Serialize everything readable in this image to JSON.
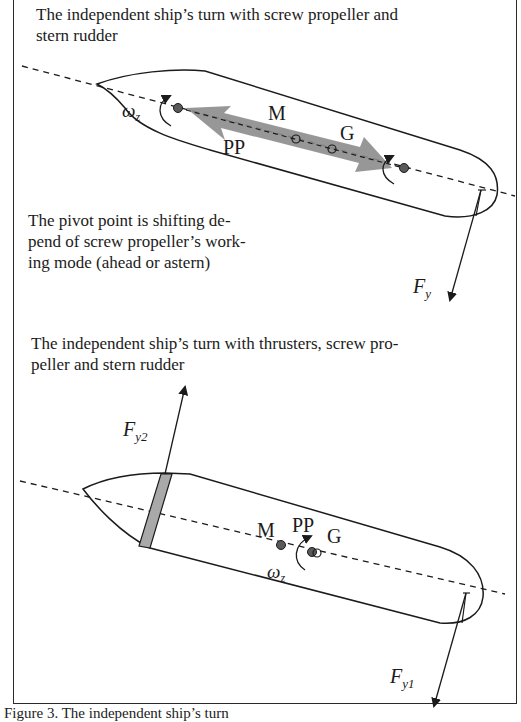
{
  "figure": {
    "panel_top": {
      "title": "The independent ship’s turn with screw propeller and stern rudder",
      "title_line1": "The independent ship’s turn with screw propeller and",
      "title_line2": "stern rudder",
      "labels": {
        "omega": "ω",
        "omega_sub": "z",
        "M": "M",
        "G": "G",
        "PP": "PP",
        "force": "F",
        "force_sub": "y"
      },
      "note_line1": "The pivot point is shifting de-",
      "note_line2": "pend of screw propeller’s work-",
      "note_line3": "ing mode (ahead or astern)"
    },
    "panel_bottom": {
      "title_line1": "The independent ship’s turn with thrusters, screw pro-",
      "title_line2": "peller and stern rudder",
      "labels": {
        "M": "M",
        "PP": "PP",
        "G": "G",
        "omega": "ω",
        "omega_sub": "z",
        "force_bow": "F",
        "force_bow_sub": "y2",
        "force_stern": "F",
        "force_stern_sub": "y1"
      }
    },
    "caption": "Figure 3. The independent ship’s turn",
    "colors": {
      "line": "#1b1b1b",
      "arrow_fill": "#8c8c8c",
      "thruster_fill": "#a9a9a9",
      "point_fill": "#5a5a5a"
    }
  }
}
